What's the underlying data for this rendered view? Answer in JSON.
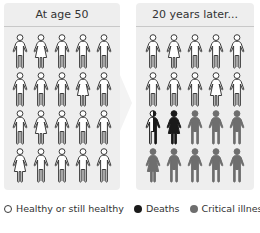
{
  "panels": [
    {
      "id": "before",
      "title": "At age 50",
      "rows": [
        [
          {
            "g": "m",
            "s": "healthy"
          },
          {
            "g": "f",
            "s": "healthy"
          },
          {
            "g": "m",
            "s": "healthy"
          },
          {
            "g": "m",
            "s": "healthy"
          },
          {
            "g": "m",
            "s": "healthy"
          }
        ],
        [
          {
            "g": "m",
            "s": "healthy"
          },
          {
            "g": "m",
            "s": "healthy"
          },
          {
            "g": "m",
            "s": "healthy"
          },
          {
            "g": "f",
            "s": "healthy"
          },
          {
            "g": "m",
            "s": "healthy"
          }
        ],
        [
          {
            "g": "m",
            "s": "healthy"
          },
          {
            "g": "f",
            "s": "healthy"
          },
          {
            "g": "m",
            "s": "healthy"
          },
          {
            "g": "m",
            "s": "healthy"
          },
          {
            "g": "m",
            "s": "healthy"
          }
        ],
        [
          {
            "g": "f",
            "s": "healthy"
          },
          {
            "g": "m",
            "s": "healthy"
          },
          {
            "g": "m",
            "s": "healthy"
          },
          {
            "g": "m",
            "s": "healthy"
          },
          {
            "g": "m",
            "s": "healthy"
          }
        ]
      ]
    },
    {
      "id": "after",
      "title": "20 years later...",
      "rows": [
        [
          {
            "g": "m",
            "s": "healthy"
          },
          {
            "g": "f",
            "s": "healthy"
          },
          {
            "g": "m",
            "s": "healthy"
          },
          {
            "g": "m",
            "s": "healthy"
          },
          {
            "g": "m",
            "s": "healthy"
          }
        ],
        [
          {
            "g": "m",
            "s": "healthy"
          },
          {
            "g": "m",
            "s": "healthy"
          },
          {
            "g": "m",
            "s": "healthy"
          },
          {
            "g": "f",
            "s": "healthy"
          },
          {
            "g": "m",
            "s": "healthy"
          }
        ],
        [
          {
            "g": "m",
            "s": "half-death"
          },
          {
            "g": "f",
            "s": "death"
          },
          {
            "g": "m",
            "s": "critical"
          },
          {
            "g": "m",
            "s": "critical"
          },
          {
            "g": "m",
            "s": "critical"
          }
        ],
        [
          {
            "g": "f",
            "s": "critical"
          },
          {
            "g": "m",
            "s": "critical"
          },
          {
            "g": "m",
            "s": "critical"
          },
          {
            "g": "m",
            "s": "critical"
          },
          {
            "g": "m",
            "s": "critical"
          }
        ]
      ]
    }
  ],
  "legend": [
    {
      "label": "Healthy or still healthy",
      "status": "healthy"
    },
    {
      "label": "Deaths",
      "status": "death"
    },
    {
      "label": "Critical illness",
      "status": "critical"
    }
  ],
  "colors": {
    "healthy_fill": "#ffffff",
    "outline": "#3a3a3a",
    "death": "#1a1a1a",
    "critical": "#6e6e6e",
    "panel_bg": "#eeeeee",
    "header_rule": "#c8c8c8"
  }
}
